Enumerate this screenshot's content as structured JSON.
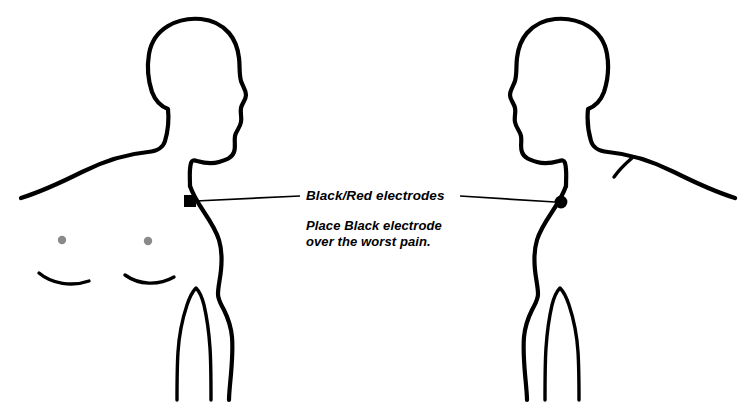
{
  "diagram": {
    "background_color": "#ffffff",
    "line_color": "#000000",
    "nipple_color": "#8a8a8a",
    "callout": {
      "title": "Black/Red electrodes",
      "instruction_line1": "Place Black electrode",
      "instruction_line2": "over the worst pain."
    },
    "figures": [
      {
        "name": "front-view-figure",
        "view": "front",
        "electrode": {
          "label": "Black/Red electrode",
          "shape": "square",
          "x": 190,
          "y": 201
        }
      },
      {
        "name": "back-view-figure",
        "view": "back",
        "electrode": {
          "label": "Black/Red electrode",
          "shape": "circle",
          "x": 561,
          "y": 202
        }
      }
    ],
    "markers": {
      "left_nipple": {
        "x": 62,
        "y": 240
      },
      "right_nipple": {
        "x": 148,
        "y": 241
      }
    }
  }
}
